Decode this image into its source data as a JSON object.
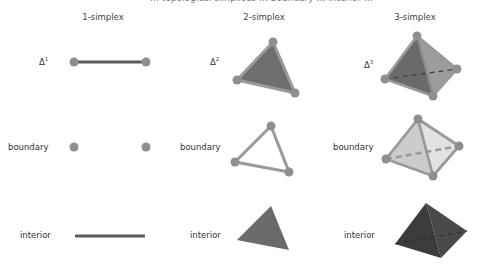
{
  "header": {
    "cropped_text": "… topological simplices … boundary … interior …"
  },
  "columns": [
    {
      "label": "1-simplex",
      "x": 103
    },
    {
      "label": "2-simplex",
      "x": 264
    },
    {
      "label": "3-simplex",
      "x": 415
    }
  ],
  "rows": {
    "simplex": {
      "labels": [
        {
          "symbol": "Δ",
          "sup": "1"
        },
        {
          "symbol": "Δ",
          "sup": "2"
        },
        {
          "symbol": "Δ",
          "sup": "3"
        }
      ]
    },
    "boundary": {
      "label": "boundary"
    },
    "interior": {
      "label": "interior"
    }
  },
  "colors": {
    "vertex": "#8f8f8f",
    "edge_dark": "#5c5c5c",
    "edge_light": "#9a9a9a",
    "face_dark": "#6a6a6a",
    "face_mid": "#7d7d7d",
    "face_light": "#c9c9c9",
    "face_lighter": "#dedede",
    "interior_dark": "#4a4a4a",
    "interior_darker": "#3a3a3a"
  }
}
